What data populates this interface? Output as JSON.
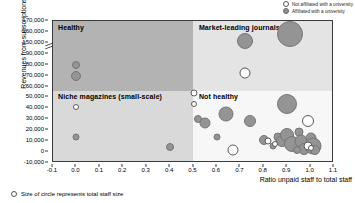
{
  "legend": {
    "items": [
      {
        "label": "Not affiliated with a university",
        "marker": "open-circle-icon",
        "style": "open"
      },
      {
        "label": "Affiliated with a university",
        "marker": "filled-circle-icon",
        "style": "filled"
      }
    ]
  },
  "footnote": {
    "marker": "open-circle-icon",
    "label": "Size of circle represents total staff size"
  },
  "quadrants": [
    {
      "key": "healthy",
      "label": "Healthy",
      "color": "#b3b3b3"
    },
    {
      "key": "market",
      "label": "Market-leading journals",
      "color": "#e4e4e4"
    },
    {
      "key": "niche",
      "label": "Niche magazines (small-scale)",
      "color": "#d9d9d9"
    },
    {
      "key": "nothealthy",
      "label": "Not healthy",
      "color": "#f7f7f7"
    }
  ],
  "chart_data": {
    "type": "scatter",
    "title": "",
    "xlabel": "Ratio unpaid staff to total staff",
    "ylabel": "Revenues from subscriptions",
    "xlim": [
      -0.1,
      1.1
    ],
    "xticks": [
      "-0.1",
      "0.0",
      "0.1",
      "0.2",
      "0.3",
      "0.4",
      "0.5",
      "0.6",
      "0.7",
      "0.8",
      "0.9",
      "1.0",
      "1.1"
    ],
    "xtickvalues": [
      -0.1,
      0.0,
      0.1,
      0.2,
      0.3,
      0.4,
      0.5,
      0.6,
      0.7,
      0.8,
      0.9,
      1.0,
      1.1
    ],
    "yticks": [
      "170,000",
      "160,000",
      "150,000",
      "90,000",
      "80,000",
      "70,000",
      "60,000",
      "50,000",
      "40,000",
      "30,000",
      "20,000",
      "10,000",
      "0",
      "-10,000"
    ],
    "ytickvalues": [
      170000,
      160000,
      150000,
      90000,
      80000,
      70000,
      60000,
      50000,
      40000,
      30000,
      20000,
      10000,
      0,
      -10000
    ],
    "axis_break": {
      "between": [
        150000,
        90000
      ],
      "note": "y-axis broken between 90,000 and 150,000"
    },
    "grid": false,
    "legend_position": "top-right",
    "quadrant_split": {
      "x": 0.5,
      "y": 50000
    },
    "size_encoding": "total staff size",
    "series": [
      {
        "name": "Affiliated with a university",
        "color": "#949494",
        "points": [
          {
            "x": 0.0,
            "y": 80000,
            "size": 8
          },
          {
            "x": 0.0,
            "y": 70000,
            "size": 10
          },
          {
            "x": 0.0,
            "y": 14000,
            "size": 7
          },
          {
            "x": 0.4,
            "y": 5000,
            "size": 8
          },
          {
            "x": 0.72,
            "y": 152000,
            "size": 16
          },
          {
            "x": 0.91,
            "y": 158000,
            "size": 26
          },
          {
            "x": 0.52,
            "y": 30000,
            "size": 8
          },
          {
            "x": 0.55,
            "y": 27000,
            "size": 11
          },
          {
            "x": 0.6,
            "y": 14000,
            "size": 7
          },
          {
            "x": 0.64,
            "y": 35000,
            "size": 15
          },
          {
            "x": 0.74,
            "y": 28000,
            "size": 12
          },
          {
            "x": 0.8,
            "y": 11000,
            "size": 10
          },
          {
            "x": 0.9,
            "y": 44000,
            "size": 20
          },
          {
            "x": 0.86,
            "y": 14000,
            "size": 9
          },
          {
            "x": 0.88,
            "y": 10000,
            "size": 12
          },
          {
            "x": 0.9,
            "y": 16000,
            "size": 14
          },
          {
            "x": 0.92,
            "y": 7000,
            "size": 16
          },
          {
            "x": 0.95,
            "y": 18000,
            "size": 9
          },
          {
            "x": 0.96,
            "y": 10000,
            "size": 13
          },
          {
            "x": 0.97,
            "y": 3000,
            "size": 12
          },
          {
            "x": 1.0,
            "y": 13000,
            "size": 11
          },
          {
            "x": 1.01,
            "y": 6000,
            "size": 17
          },
          {
            "x": 1.02,
            "y": 1500,
            "size": 10
          },
          {
            "x": 0.94,
            "y": 2000,
            "size": 8
          },
          {
            "x": 0.84,
            "y": 6000,
            "size": 7
          }
        ]
      },
      {
        "name": "Not affiliated with a university",
        "color": "#ffffff",
        "points": [
          {
            "x": 0.0,
            "y": 41000,
            "size": 6
          },
          {
            "x": 0.5,
            "y": 54000,
            "size": 7
          },
          {
            "x": 0.5,
            "y": 44000,
            "size": 6
          },
          {
            "x": 0.72,
            "y": 72000,
            "size": 11
          },
          {
            "x": 0.67,
            "y": 1500,
            "size": 11
          },
          {
            "x": 0.82,
            "y": 10000,
            "size": 7
          },
          {
            "x": 0.85,
            "y": 7000,
            "size": 6
          },
          {
            "x": 0.99,
            "y": 28000,
            "size": 12
          },
          {
            "x": 0.99,
            "y": 6000,
            "size": 9
          },
          {
            "x": 1.0,
            "y": 4000,
            "size": 6
          }
        ]
      }
    ]
  }
}
